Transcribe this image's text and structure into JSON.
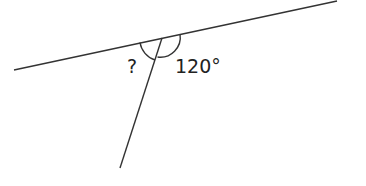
{
  "diagram": {
    "type": "angles-on-a-straight-line",
    "labels": {
      "unknown_angle": "?",
      "known_angle": "120°"
    },
    "known_angle_value": 120,
    "stroke_color": "#333333"
  }
}
